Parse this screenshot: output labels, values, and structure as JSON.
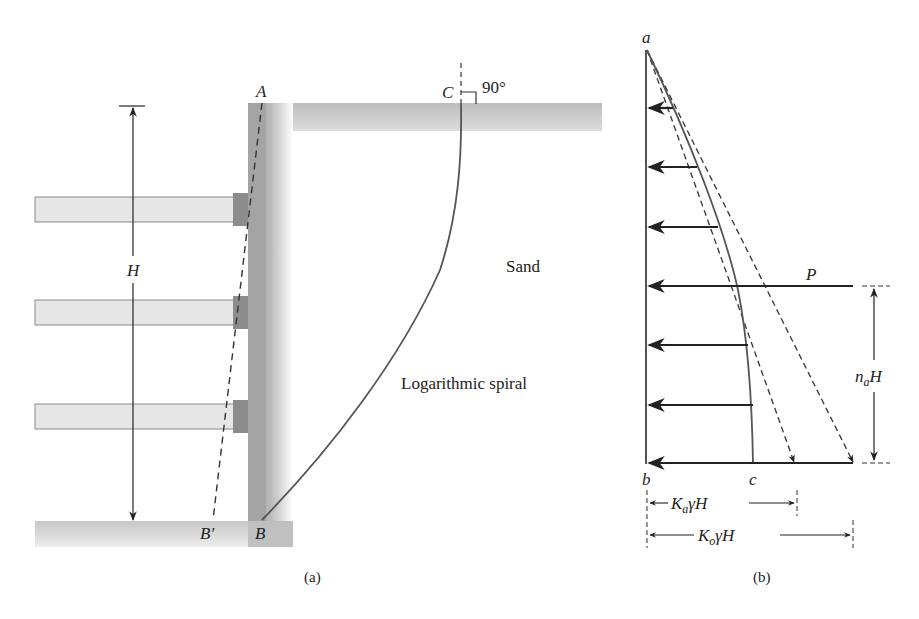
{
  "figure": {
    "panel_a": {
      "caption": "(a)",
      "labels": {
        "A": "A",
        "B": "B",
        "B_prime": "B′",
        "C": "C",
        "H": "H",
        "angle": "90°",
        "sand": "Sand",
        "spiral": "Logarithmic spiral"
      },
      "struts": 3
    },
    "panel_b": {
      "caption": "(b)",
      "labels": {
        "a": "a",
        "b": "b",
        "c": "c",
        "P": "P",
        "na": "n",
        "na_sub": "a",
        "na_H": "H",
        "Ka_K": "K",
        "Ka_sub": "a",
        "Ka_rest": "γH",
        "Ko_K": "K",
        "Ko_sub": "o",
        "Ko_rest": "γH"
      },
      "pressure_arrows": 7
    }
  },
  "colors": {
    "wall": "#a9a9a9",
    "ground": "#c4c4c4",
    "strut": "#e6e6e6",
    "strut_block": "#8c8c8c",
    "line": "#333333"
  }
}
